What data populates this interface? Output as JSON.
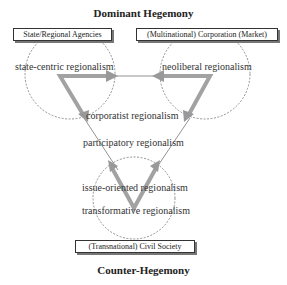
{
  "titles": {
    "top": "Dominant Hegemony",
    "bottom": "Counter-Hegemony"
  },
  "actors": {
    "state": "State/Regional Agencies",
    "market": "(Multinational) Corporation (Market)",
    "civil": "(Transnational) Civil Society"
  },
  "regionalisms": {
    "state_centric": "state-centric regionalism",
    "neoliberal": "neoliberal regionalism",
    "corporatist": "corporatist regionalism",
    "participatory": "participatory regionalism",
    "issue_oriented": "issue-oriented regionalism",
    "transformative": "transformative regionalism"
  },
  "colors": {
    "arrow": "#999999",
    "line": "#555555",
    "circle": "#666666"
  }
}
